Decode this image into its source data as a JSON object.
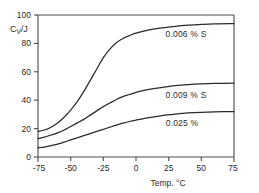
{
  "chart_data": {
    "type": "line",
    "title": "",
    "subtitle": "",
    "xlabel": "Temp.  °C",
    "ylabel": "C",
    "ylabel_sub": "V",
    "ylabel_rest": "/J",
    "ylabel_full": "C_V/J",
    "xlim": [
      -75,
      75
    ],
    "ylim": [
      0,
      100
    ],
    "xticks": [
      -75,
      -50,
      -25,
      0,
      25,
      50,
      75
    ],
    "xticklabels": [
      "-75",
      "-50",
      "-25",
      "0",
      "25",
      "50",
      "75"
    ],
    "yticks": [
      0,
      20,
      40,
      60,
      80,
      100
    ],
    "yticklabels": [
      "0",
      "20",
      "40",
      "60",
      "80",
      "100"
    ],
    "grid": false,
    "legend_position": "inline-right",
    "series": [
      {
        "name": "0.006 % S",
        "label": "0.006 % S",
        "label_x": 38,
        "label_y": 88,
        "x": [
          -75,
          -70,
          -65,
          -60,
          -55,
          -50,
          -45,
          -40,
          -35,
          -30,
          -25,
          -20,
          -15,
          -10,
          -5,
          0,
          10,
          20,
          30,
          40,
          50,
          60,
          75
        ],
        "y": [
          18,
          19,
          21,
          24,
          28,
          33,
          39,
          46,
          54,
          62,
          70,
          76,
          80.5,
          83.5,
          85.5,
          87.2,
          89.5,
          91,
          92,
          92.8,
          93.4,
          93.8,
          94
        ]
      },
      {
        "name": "0.009 % S",
        "label": "0.009 % S",
        "label_x": 38,
        "label_y": 44,
        "x": [
          -75,
          -70,
          -65,
          -60,
          -55,
          -50,
          -45,
          -40,
          -35,
          -30,
          -25,
          -20,
          -15,
          -10,
          -5,
          0,
          10,
          20,
          30,
          40,
          50,
          60,
          75
        ],
        "y": [
          13,
          14,
          15.5,
          17,
          19,
          21.5,
          24,
          26.5,
          29.5,
          32.5,
          35.5,
          38,
          40.5,
          42.5,
          44,
          45.5,
          47.6,
          49,
          50.2,
          51,
          51.5,
          51.8,
          52
        ]
      },
      {
        "name": "0.025 %",
        "label": "0.025 %",
        "label_x": 38,
        "label_y": 26,
        "x": [
          -75,
          -70,
          -65,
          -60,
          -55,
          -50,
          -45,
          -40,
          -35,
          -30,
          -25,
          -20,
          -15,
          -10,
          -5,
          0,
          10,
          20,
          30,
          40,
          50,
          60,
          75
        ],
        "y": [
          6.5,
          7,
          8,
          9,
          10.5,
          12,
          13.5,
          15,
          16.5,
          18,
          19.5,
          21,
          22.5,
          23.8,
          25,
          26,
          27.8,
          29.2,
          30.2,
          31,
          31.5,
          31.8,
          32
        ]
      }
    ],
    "top_border_value": 100,
    "colors": {
      "curve": "#2b2b2b",
      "axis": "#4a4a4a",
      "background": "#ffffff"
    }
  }
}
